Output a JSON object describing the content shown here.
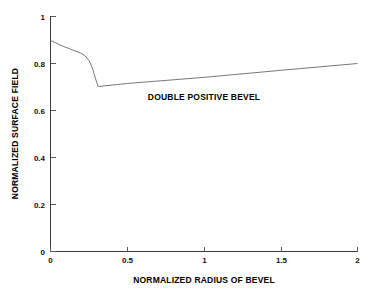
{
  "chart_data": {
    "type": "line",
    "title": "",
    "xlabel": "NORMALIZED RADIUS OF BEVEL",
    "ylabel": "NORMALIZED SURFACE FIELD",
    "xlim": [
      0,
      2
    ],
    "ylim": [
      0,
      1
    ],
    "grid": false,
    "legend": null,
    "xticks": [
      0,
      0.5,
      1,
      1.5,
      2
    ],
    "xticklabels": [
      "0",
      "0.5",
      "1",
      "1.5",
      "2"
    ],
    "yticks": [
      0,
      0.2,
      0.4,
      0.6,
      0.8,
      1
    ],
    "yticklabels": [
      "0",
      "0.2",
      "0.4",
      "0.6",
      "0.8",
      "1"
    ],
    "annotations": [
      {
        "text": "DOUBLE POSITIVE BEVEL",
        "x": 1.0,
        "y": 0.645
      }
    ],
    "series": [
      {
        "name": "double positive bevel",
        "color": "#777777",
        "x": [
          0.0,
          0.065,
          0.13,
          0.195,
          0.225,
          0.252,
          0.275,
          0.292,
          0.31,
          0.5,
          1.0,
          1.5,
          2.0
        ],
        "values": [
          0.898,
          0.878,
          0.861,
          0.845,
          0.833,
          0.812,
          0.776,
          0.738,
          0.702,
          0.715,
          0.741,
          0.771,
          0.8
        ]
      }
    ]
  },
  "axes": {
    "x_title": "NORMALIZED RADIUS OF BEVEL",
    "y_title": "NORMALIZED SURFACE FIELD",
    "x_tick_labels": [
      "0",
      "0.5",
      "1",
      "1.5",
      "2"
    ],
    "y_tick_labels": [
      "0",
      "0.2",
      "0.4",
      "0.6",
      "0.8",
      "1"
    ]
  },
  "annotation": {
    "text": "DOUBLE POSITIVE BEVEL"
  },
  "colors": {
    "curve": "#777777",
    "axis": "#3a3a3a",
    "text": "#000000",
    "background": "#ffffff"
  }
}
